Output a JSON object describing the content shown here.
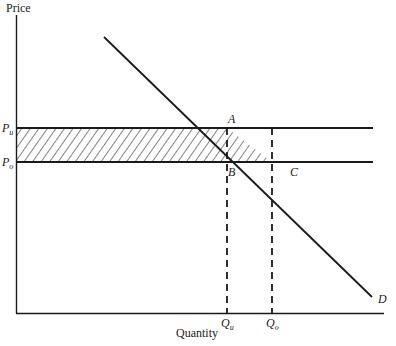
{
  "diagram": {
    "type": "economics-price-ceiling-demand",
    "y_axis_label": "Price",
    "x_axis_label": "Quantity",
    "price_labels": {
      "upper": {
        "main": "P",
        "sub": "u"
      },
      "lower": {
        "main": "P",
        "sub": "o"
      }
    },
    "quantity_labels": {
      "left": {
        "main": "Q",
        "sub": "u"
      },
      "right": {
        "main": "Q",
        "sub": "o"
      }
    },
    "points": {
      "A": "A",
      "B": "B",
      "C": "C"
    },
    "curve_label": "D",
    "colors": {
      "line": "#1a1a1a",
      "background": "#ffffff",
      "hatch": "#1a1a1a"
    },
    "shaded_region": "Hatched area between Pu and Po from the price axis to the demand curve (rectangle to Qu plus triangle ABC)"
  }
}
